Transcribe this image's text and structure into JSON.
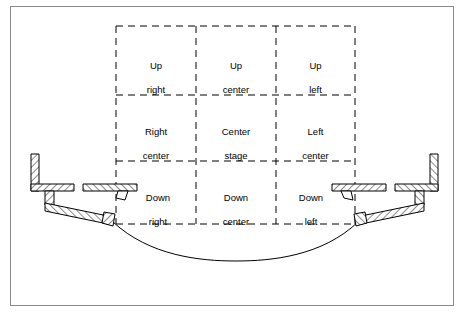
{
  "figure": {
    "border_color": "#8a8a8a",
    "line_color": "#000000",
    "background": "#ffffff"
  },
  "stage_grid": {
    "rows": [
      {
        "row_name": "upstage",
        "cells": [
          {
            "name": "up-right",
            "line1": "Up",
            "line2": "right"
          },
          {
            "name": "up-center",
            "line1": "Up",
            "line2": "center"
          },
          {
            "name": "up-left",
            "line1": "Up",
            "line2": "left"
          }
        ]
      },
      {
        "row_name": "center",
        "cells": [
          {
            "name": "right-center",
            "line1": "Right",
            "line2": "center"
          },
          {
            "name": "center-stage",
            "line1": "Center",
            "line2": "stage"
          },
          {
            "name": "left-center",
            "line1": "Left",
            "line2": "center"
          }
        ]
      },
      {
        "row_name": "downstage",
        "cells": [
          {
            "name": "down-right",
            "line1": "Down",
            "line2": "right"
          },
          {
            "name": "down-center",
            "line1": "Down",
            "line2": "center"
          },
          {
            "name": "down-left",
            "line1": "Down",
            "line2": "left"
          }
        ]
      }
    ]
  },
  "structure": {
    "left_wall": "proscenium-wall-left",
    "right_wall": "proscenium-wall-right",
    "left_tormentor": "tormentor-flat-left",
    "right_tormentor": "tormentor-flat-right",
    "apron_curve": "curved-apron-edge"
  }
}
